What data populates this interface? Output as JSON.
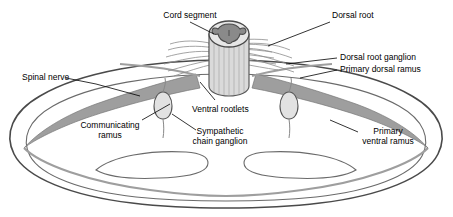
{
  "figure": {
    "type": "anatomical-line-diagram",
    "background_color": "#ffffff",
    "line_color": "#3f3f3f",
    "fill_gray_dark": "#9a9a9a",
    "fill_gray_mid": "#b9b9b9",
    "fill_gray_light": "#d8d8d8",
    "fill_gray_pale": "#ececec"
  },
  "labels": {
    "cord_segment": "Cord segment",
    "dorsal_root": "Dorsal root",
    "dorsal_root_ganglion": "Dorsal root ganglion",
    "primary_dorsal_ramus": "Primary dorsal ramus",
    "spinal_nerve": "Spinal nerve",
    "ventral_rootlets": "Ventral rootlets",
    "communicating_ramus": "Communicating\nramus",
    "sympathetic_chain_ganglion": "Sympathetic\nchain ganglion",
    "primary_ventral_ramus": "Primary\nventral ramus"
  }
}
